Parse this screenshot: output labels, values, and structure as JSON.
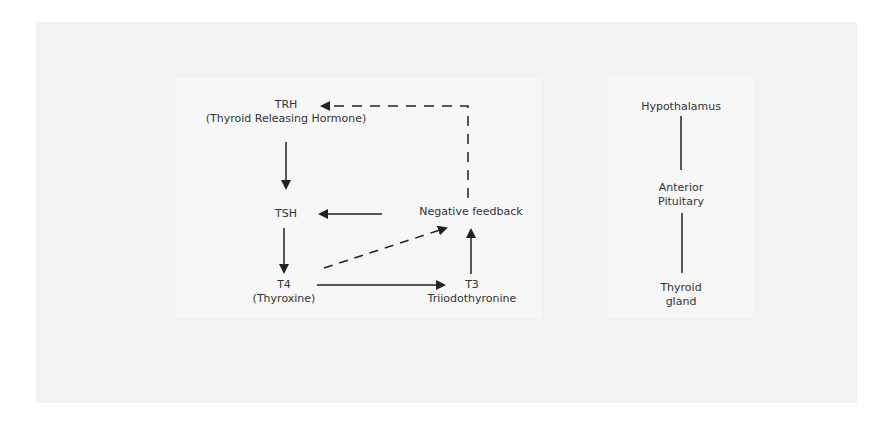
{
  "diagram": {
    "feedback_loop": {
      "nodes": {
        "trh": {
          "title": "TRH",
          "subtitle": "(Thyroid Releasing Hormone)"
        },
        "tsh": {
          "title": "TSH"
        },
        "t4": {
          "title": "T4",
          "subtitle": "(Thyroxine)"
        },
        "t3": {
          "title": "T3",
          "subtitle": "Triiodothyronine"
        },
        "negative_feedback": {
          "title": "Negative feedback"
        }
      },
      "edges": [
        {
          "from": "TRH",
          "to": "TSH",
          "style": "solid"
        },
        {
          "from": "TSH",
          "to": "T4",
          "style": "solid"
        },
        {
          "from": "T4",
          "to": "T3",
          "style": "solid"
        },
        {
          "from": "T3",
          "to": "Negative feedback",
          "style": "solid"
        },
        {
          "from": "Negative feedback",
          "to": "TSH",
          "style": "solid"
        },
        {
          "from": "Negative feedback",
          "to": "TRH",
          "style": "dashed"
        },
        {
          "from": "T4",
          "to": "Negative feedback",
          "style": "dashed"
        }
      ]
    },
    "anatomy": {
      "nodes": [
        {
          "label_line1": "Hypothalamus"
        },
        {
          "label_line1": "Anterior",
          "label_line2": "Pituitary"
        },
        {
          "label_line1": "Thyroid",
          "label_line2": "gland"
        }
      ]
    },
    "colors": {
      "line": "#222222",
      "text": "#333333",
      "panel": "#f2f2f2",
      "box": "#f7f7f7"
    }
  }
}
